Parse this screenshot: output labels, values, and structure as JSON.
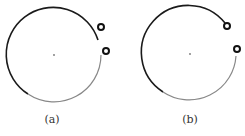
{
  "figures": [
    {
      "id": "a",
      "caption": "(a)",
      "circle": {
        "cx": 54,
        "cy": 55,
        "r": 47
      },
      "center_dot": {
        "cx": 54,
        "cy": 55
      },
      "rings": [
        {
          "cx": 101,
          "cy": 27
        },
        {
          "cx": 106,
          "cy": 51
        }
      ]
    },
    {
      "id": "b",
      "caption": "(b)",
      "circle": {
        "cx": 190,
        "cy": 54,
        "r": 47
      },
      "center_dot": {
        "cx": 190,
        "cy": 54
      },
      "rings": [
        {
          "cx": 227,
          "cy": 26
        },
        {
          "cx": 237,
          "cy": 49
        }
      ]
    }
  ],
  "colors": {
    "stroke_dark": "#1a1a1a",
    "stroke_light": "#888888",
    "dot": "#777777"
  }
}
